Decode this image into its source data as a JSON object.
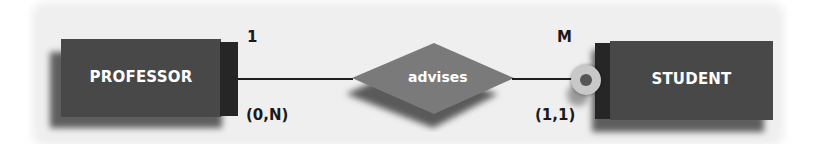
{
  "diagram": {
    "type": "entity-relationship",
    "entities": [
      {
        "id": "professor",
        "label": "PROFESSOR"
      },
      {
        "id": "student",
        "label": "STUDENT"
      }
    ],
    "relationship": {
      "label": "advises",
      "left_cardinality": "1",
      "left_participation": "(0,N)",
      "right_cardinality": "M",
      "right_participation": "(1,1)"
    },
    "colors": {
      "background": "#efefef",
      "entity_fill": "#484848",
      "entity_side": "#262626",
      "relationship_fill": "#7a7a7a",
      "line": "#1e1e1e",
      "participation_ring": "#c8c8c8",
      "participation_core": "#555555"
    }
  }
}
